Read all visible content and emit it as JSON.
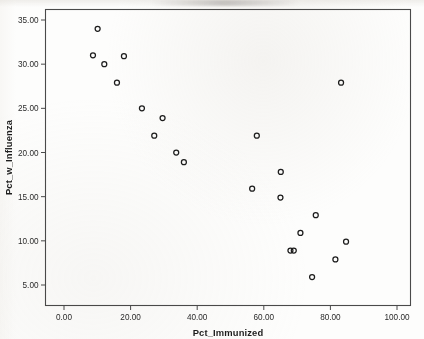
{
  "chart_data": {
    "type": "scatter",
    "title": "",
    "xlabel": "Pct_Immunized",
    "ylabel": "Pct_w_Influenza",
    "xlim": [
      0.0,
      106.0
    ],
    "ylim": [
      3.4,
      36.6
    ],
    "xticks": [
      0.0,
      20.0,
      40.0,
      60.0,
      80.0,
      100.0
    ],
    "xtick_labels": [
      "0.00",
      "20.00",
      "40.00",
      "60.00",
      "80.00",
      "100.00"
    ],
    "yticks": [
      5.0,
      10.0,
      15.0,
      20.0,
      25.0,
      30.0,
      35.0
    ],
    "ytick_labels": [
      "5.00",
      "10.00",
      "15.00",
      "20.00",
      "25.00",
      "30.00",
      "35.00"
    ],
    "grid": false,
    "legend": "none",
    "marker": "open-circle",
    "marker_color": "#1c1c1c",
    "points": [
      {
        "x": 10.1,
        "y": 34.0
      },
      {
        "x": 8.7,
        "y": 31.0
      },
      {
        "x": 12.1,
        "y": 30.0
      },
      {
        "x": 18.0,
        "y": 30.9
      },
      {
        "x": 15.9,
        "y": 27.9
      },
      {
        "x": 23.4,
        "y": 25.0
      },
      {
        "x": 29.6,
        "y": 23.9
      },
      {
        "x": 27.1,
        "y": 21.9
      },
      {
        "x": 33.7,
        "y": 20.0
      },
      {
        "x": 36.0,
        "y": 18.9
      },
      {
        "x": 56.5,
        "y": 15.9
      },
      {
        "x": 57.9,
        "y": 21.9
      },
      {
        "x": 65.1,
        "y": 17.8
      },
      {
        "x": 65.0,
        "y": 14.9
      },
      {
        "x": 68.0,
        "y": 8.9
      },
      {
        "x": 69.0,
        "y": 8.9
      },
      {
        "x": 71.0,
        "y": 10.9
      },
      {
        "x": 74.5,
        "y": 5.9
      },
      {
        "x": 75.6,
        "y": 12.9
      },
      {
        "x": 81.5,
        "y": 7.9
      },
      {
        "x": 83.2,
        "y": 27.9
      },
      {
        "x": 84.7,
        "y": 9.9
      }
    ]
  },
  "axes": {
    "x_title": "Pct_Immunized",
    "y_title": "Pct_w_Influenza"
  }
}
